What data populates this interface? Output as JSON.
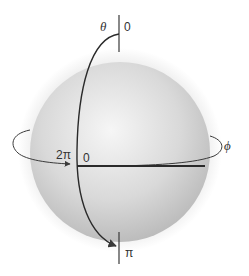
{
  "figure": {
    "colors": {
      "background": "#ffffff",
      "halo": "#f2f2f2",
      "sphere_light": "#f4f4f4",
      "sphere_dark": "#b9b9b9",
      "stroke": "#3a3a3a",
      "text": "#333333"
    },
    "labels": {
      "theta_symbol": "θ",
      "theta_start": "0",
      "theta_end": "π",
      "phi_symbol": "ϕ",
      "phi_start": "0",
      "phi_end": "2π"
    }
  }
}
